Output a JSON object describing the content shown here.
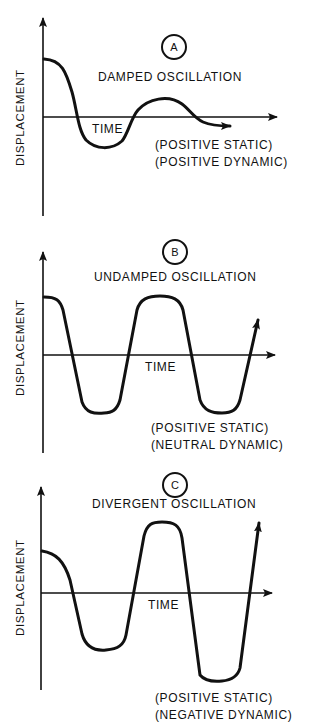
{
  "figure": {
    "panels": [
      {
        "id": "A",
        "title": "DAMPED OSCILLATION",
        "xlabel": "TIME",
        "ylabel": "DISPLACEMENT",
        "note_line1": "(POSITIVE STATIC)",
        "note_line2": "(POSITIVE DYNAMIC)"
      },
      {
        "id": "B",
        "title": "UNDAMPED OSCILLATION",
        "xlabel": "TIME",
        "ylabel": "DISPLACEMENT",
        "note_line1": "(POSITIVE STATIC)",
        "note_line2": "(NEUTRAL DYNAMIC)"
      },
      {
        "id": "C",
        "title": "DIVERGENT OSCILLATION",
        "xlabel": "TIME",
        "ylabel": "DISPLACEMENT",
        "note_line1": "(POSITIVE STATIC)",
        "note_line2": "(NEGATIVE DYNAMIC)"
      }
    ]
  },
  "colors": {
    "ink": "#111111",
    "background": "#ffffff"
  }
}
